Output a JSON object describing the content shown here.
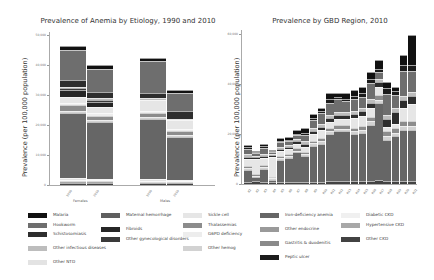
{
  "palette": {
    "Malaria": "#111111",
    "Hookworm": "#6e6e6e",
    "Schistosomiasis": "#2e2e2e",
    "Other infectious diseases": "#bdbdbd",
    "Other NTD": "#e3e3e3",
    "Maternal hemorrhage": "#5f5f5f",
    "Fibroids": "#262626",
    "Other gynecological disorders": "#3a3a3a",
    "Sickle cell": "#e6e6e6",
    "Thalassemias": "#8c8c8c",
    "G6PD deficiency": "#ededed",
    "Other hemog": "#d2d2d2",
    "Iron-deficiency anemia": "#666666",
    "Other endocrine": "#9a9a9a",
    "Gastritis & duodenitis": "#8a8a8a",
    "Peptic ulcer": "#1c1c1c",
    "Diabetic CKD": "#f0f0f0",
    "Hypertensive CKD": "#a8a8a8",
    "Other CKD": "#424242"
  },
  "legend": {
    "columns": [
      [
        "Malaria",
        "Hookworm",
        "Schistosomiasis",
        "Other infectious diseases",
        "Other NTD"
      ],
      [
        "Maternal hemorrhage",
        "Fibroids",
        "Other gynecological disorders"
      ],
      [
        "Sickle cell",
        "Thalassemias",
        "G6PD deficiency",
        "Other hemog"
      ],
      [
        "Iron-deficiency anemia",
        "Other endocrine",
        "Gastritis & duodenitis",
        "Peptic ulcer"
      ],
      [
        "Diabetic CKD",
        "Hypertensive CKD",
        "Other CKD"
      ]
    ],
    "labels": {
      "Malaria": "Malaria",
      "Hookworm": "Hookworm",
      "Schistosomiasis": "Schistosomiasis",
      "Other infectious diseases": "Other infectious diseases",
      "Other NTD": "Other NTD",
      "Maternal hemorrhage": "Maternal hemorrhage",
      "Fibroids": "Fibroids",
      "Other gynecological disorders": "Other gynecological disorders",
      "Sickle cell": "Sickle cell",
      "Thalassemias": "Thalassemias",
      "G6PD deficiency": "G6PD deficiency",
      "Other hemog": "Other hemog",
      "Iron-deficiency anemia": "Iron-deficiency anemia",
      "Other endocrine": "Other endocrine",
      "Gastritis & duodenitis": "Gastritis & duodenitis",
      "Peptic ulcer": "Peptic ulcer",
      "Diabetic CKD": "Diabetic CKD",
      "Hypertensive CKD": "Hypertensive CKD",
      "Other CKD": "Other CKD"
    }
  },
  "chart_data": [
    {
      "type": "bar",
      "stacked": true,
      "title": "Prevalence of Anemia by Etiology, 1990 and 2010",
      "xlabel": "",
      "ylabel": "Prevalence (per 100,000 population)",
      "ylim": [
        0,
        50000
      ],
      "yticks": [
        "0",
        "10,000",
        "20,000",
        "30,000",
        "40,000",
        "50,000"
      ],
      "groups": [
        "Females",
        "Males"
      ],
      "categories": [
        "1990",
        "2010",
        "1990",
        "2010"
      ],
      "totals": [
        46300,
        40000,
        41700,
        31700
      ],
      "series": [
        {
          "name": "Other CKD",
          "values": [
            700,
            700,
            600,
            600
          ]
        },
        {
          "name": "Hypertensive CKD",
          "values": [
            500,
            500,
            400,
            400
          ]
        },
        {
          "name": "Diabetic CKD",
          "values": [
            300,
            300,
            200,
            200
          ]
        },
        {
          "name": "Other NTD",
          "values": [
            700,
            600,
            600,
            500
          ]
        },
        {
          "name": "Iron-deficiency anemia",
          "values": [
            21800,
            18800,
            20200,
            14300
          ]
        },
        {
          "name": "Other hemog",
          "values": [
            600,
            600,
            500,
            500
          ]
        },
        {
          "name": "Thalassemias",
          "values": [
            2000,
            1600,
            1500,
            1500
          ]
        },
        {
          "name": "G6PD deficiency",
          "values": [
            800,
            800,
            600,
            600
          ]
        },
        {
          "name": "Sickle cell",
          "values": [
            1800,
            2000,
            3600,
            2800
          ]
        },
        {
          "name": "Fibroids",
          "values": [
            2300,
            1800,
            0,
            0
          ]
        },
        {
          "name": "Other gynecological disorders",
          "values": [
            700,
            700,
            0,
            0
          ]
        },
        {
          "name": "Other infectious diseases",
          "values": [
            600,
            500,
            700,
            600
          ]
        },
        {
          "name": "Schistosomiasis",
          "values": [
            2200,
            2000,
            1800,
            2400
          ]
        },
        {
          "name": "Hookworm",
          "values": [
            10000,
            7800,
            10400,
            6300
          ]
        },
        {
          "name": "Malaria",
          "values": [
            1300,
            1300,
            1200,
            1000
          ]
        }
      ]
    },
    {
      "type": "bar",
      "stacked": true,
      "title": "Prevalence by GBD Region, 2010",
      "xlabel": "",
      "ylabel": "Prevalence (per 100,000 population)",
      "ylim": [
        0,
        60000
      ],
      "yticks": [
        "0",
        "20,000",
        "40,000",
        "60,000"
      ],
      "categories": [
        "R1",
        "R2",
        "R3",
        "R4",
        "R5",
        "R6",
        "R7",
        "R8",
        "R9",
        "R10",
        "R11",
        "R12",
        "R13",
        "R14",
        "R15",
        "R16",
        "R17",
        "R18",
        "R19",
        "R20",
        "R21"
      ],
      "totals": [
        15600,
        13200,
        16000,
        13200,
        18400,
        18800,
        21600,
        22400,
        28000,
        30400,
        36400,
        36400,
        36400,
        37600,
        38800,
        44800,
        49600,
        40800,
        38800,
        51600,
        59600,
        58800
      ]
    }
  ]
}
